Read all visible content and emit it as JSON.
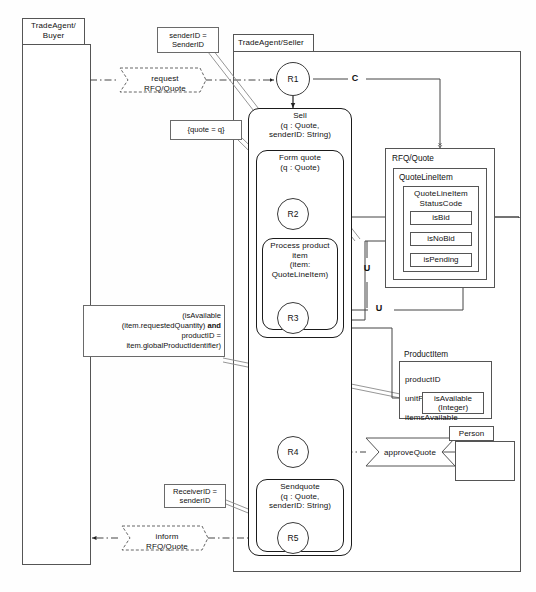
{
  "diagram": {
    "type": "uml-activity-collaboration-diagram",
    "lanes": [
      {
        "id": "buyer",
        "title": "TradeAgent/\nBuyer"
      },
      {
        "id": "seller",
        "title": "TradeAgent/Seller"
      }
    ],
    "messages": [
      {
        "id": "request-rfq",
        "label": "request\nRFQ/Quote"
      },
      {
        "id": "inform-rfq",
        "label": "inform\nRFQ/Quote"
      }
    ],
    "notes": [
      {
        "id": "note-senderid",
        "text": "senderID =\nSenderID"
      },
      {
        "id": "note-quote",
        "text": "{quote = q}"
      },
      {
        "id": "note-isavailable",
        "text": "(isAvailable\n(item.requestedQuantity) and\nproductID =\nitem.globalProductIdentifier)"
      },
      {
        "id": "note-receiverid",
        "text": "ReceiverID =\nsenderID"
      }
    ],
    "states": [
      {
        "id": "r1",
        "label": "R1"
      },
      {
        "id": "r2",
        "label": "R2"
      },
      {
        "id": "r3",
        "label": "R3"
      },
      {
        "id": "r4",
        "label": "R4"
      },
      {
        "id": "r5",
        "label": "R5"
      }
    ],
    "activities": [
      {
        "id": "sell",
        "label": "Sell\n(q : Quote,\nsenderID: String)"
      },
      {
        "id": "form-quote",
        "label": "Form quote\n(q : Quote)"
      },
      {
        "id": "process-product",
        "label": "Process product\nitem\n(item:\nQuoteLineItem)"
      },
      {
        "id": "sendquote",
        "label": "Sendquote\n(q : Quote,\nsenderID: String)"
      }
    ],
    "classes": [
      {
        "id": "rfq-quote",
        "name": "RFQ/Quote",
        "nested": {
          "id": "quote-line-item",
          "name": "QuoteLineItem",
          "nested": {
            "id": "status-code",
            "name": "QuoteLineItem\nStatusCode",
            "enum": [
              "isBid",
              "isNoBid",
              "isPending"
            ]
          }
        }
      },
      {
        "id": "product-item",
        "name": "ProductItem",
        "attributes": [
          "productID",
          "unitPrice",
          "itemsAvailable"
        ],
        "operation": "isAvailable\n(Integer)"
      },
      {
        "id": "person",
        "name": "Person"
      }
    ],
    "edge_labels": [
      {
        "id": "edge-c",
        "label": "C"
      },
      {
        "id": "edge-u1",
        "label": "U"
      },
      {
        "id": "edge-u2",
        "label": "U"
      }
    ],
    "actions": [
      {
        "id": "approve-quote",
        "label": "approveQuote"
      }
    ],
    "colors": {
      "stroke": "#555555",
      "stroke_dark": "#1b1b1b",
      "background": "#ffffff"
    }
  }
}
